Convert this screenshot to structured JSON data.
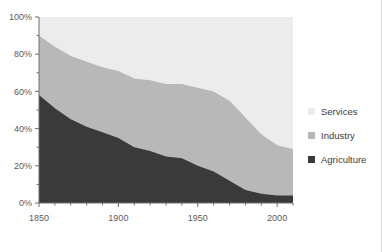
{
  "chart_data": {
    "type": "area",
    "stacked": true,
    "normalized": true,
    "title": "",
    "subtitle": "",
    "xlabel": "",
    "ylabel": "",
    "xlim": [
      1850,
      2010
    ],
    "ylim": [
      0,
      100
    ],
    "grid": false,
    "legend_position": "right",
    "x_major_ticks": [
      1850,
      1900,
      1950,
      2000
    ],
    "x_major_tick_labels": [
      "1850",
      "1900",
      "1950",
      "2000"
    ],
    "x_minor_tick_step": 10,
    "y_major_ticks": [
      0,
      20,
      40,
      60,
      80,
      100
    ],
    "y_major_tick_labels": [
      "0%",
      "20%",
      "40%",
      "60%",
      "80%",
      "100%"
    ],
    "y_minor_tick_step": 10,
    "x": [
      1850,
      1860,
      1870,
      1880,
      1890,
      1900,
      1910,
      1920,
      1930,
      1940,
      1950,
      1960,
      1970,
      1980,
      1990,
      2000,
      2010
    ],
    "series": [
      {
        "name": "Agriculture",
        "color": "#3a3a3a",
        "values": [
          58,
          51,
          45,
          41,
          38,
          35,
          30,
          28,
          25,
          24,
          20,
          17,
          12,
          7,
          5,
          4,
          4
        ]
      },
      {
        "name": "Industry",
        "color": "#b8b8b8",
        "values": [
          32,
          33,
          34,
          35,
          35,
          36,
          37,
          38,
          39,
          40,
          42,
          43,
          43,
          39,
          32,
          27,
          25
        ]
      },
      {
        "name": "Services",
        "color": "#ececec",
        "values": [
          10,
          16,
          21,
          24,
          27,
          29,
          33,
          34,
          36,
          36,
          38,
          40,
          45,
          54,
          63,
          69,
          71
        ]
      }
    ],
    "stack_order_bottom_to_top": [
      "Agriculture",
      "Industry",
      "Services"
    ],
    "boundary_agriculture_top": [
      58,
      51,
      45,
      41,
      38,
      35,
      30,
      28,
      25,
      24,
      20,
      17,
      12,
      7,
      5,
      4,
      4
    ],
    "boundary_industry_top": [
      90,
      84,
      79,
      76,
      73,
      71,
      67,
      66,
      64,
      64,
      62,
      60,
      55,
      46,
      37,
      31,
      29
    ]
  },
  "legend": {
    "items": [
      {
        "label": "Services",
        "color": "#ececec"
      },
      {
        "label": "Industry",
        "color": "#b8b8b8"
      },
      {
        "label": "Agriculture",
        "color": "#3a3a3a"
      }
    ]
  },
  "axes": {
    "y_labels": [
      "100%",
      "80%",
      "60%",
      "40%",
      "20%",
      "0%"
    ],
    "x_labels": [
      "1850",
      "1900",
      "1950",
      "2000"
    ]
  },
  "colors": {
    "services": "#ececec",
    "industry": "#b8b8b8",
    "agriculture": "#3a3a3a",
    "axis": "#6e6e6e",
    "tick_text": "#5a5a5a",
    "background": "#ffffff"
  }
}
